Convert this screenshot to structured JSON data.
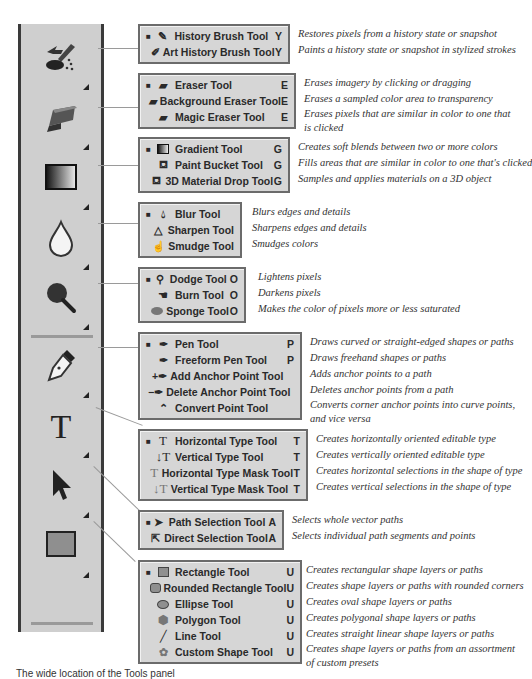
{
  "groups": [
    {
      "id": "history",
      "toolbar_icon": "history-brush-icon",
      "tools": [
        {
          "name": "History Brush Tool",
          "key": "Y",
          "icon": "history-brush-icon",
          "default": true,
          "desc": "Restores pixels from a history state or snapshot"
        },
        {
          "name": "Art History Brush Tool",
          "key": "Y",
          "icon": "art-history-brush-icon",
          "default": false,
          "desc": "Paints a history state or snapshot in stylized strokes"
        }
      ]
    },
    {
      "id": "eraser",
      "toolbar_icon": "eraser-icon",
      "tools": [
        {
          "name": "Eraser Tool",
          "key": "E",
          "icon": "eraser-icon",
          "default": true,
          "desc": "Erases imagery by clicking or dragging"
        },
        {
          "name": "Background Eraser Tool",
          "key": "E",
          "icon": "background-eraser-icon",
          "default": false,
          "desc": "Erases a sampled color area to transparency"
        },
        {
          "name": "Magic Eraser Tool",
          "key": "E",
          "icon": "magic-eraser-icon",
          "default": false,
          "desc": "Erases pixels that are similar in color to one that is clicked"
        }
      ]
    },
    {
      "id": "gradient",
      "toolbar_icon": "gradient-icon",
      "tools": [
        {
          "name": "Gradient Tool",
          "key": "G",
          "icon": "gradient-icon",
          "default": true,
          "desc": "Creates soft blends between two or more colors"
        },
        {
          "name": "Paint Bucket Tool",
          "key": "G",
          "icon": "paint-bucket-icon",
          "default": false,
          "desc": "Fills areas that are similar in color to one that's clicked"
        },
        {
          "name": "3D Material Drop Tool",
          "key": "G",
          "icon": "material-drop-icon",
          "default": false,
          "desc": "Samples and applies materials on a 3D object"
        }
      ]
    },
    {
      "id": "blur",
      "toolbar_icon": "blur-icon",
      "tools": [
        {
          "name": "Blur Tool",
          "key": "",
          "icon": "blur-icon",
          "default": true,
          "desc": "Blurs edges and details"
        },
        {
          "name": "Sharpen Tool",
          "key": "",
          "icon": "sharpen-icon",
          "default": false,
          "desc": "Sharpens edges and details"
        },
        {
          "name": "Smudge Tool",
          "key": "",
          "icon": "smudge-icon",
          "default": false,
          "desc": "Smudges colors"
        }
      ]
    },
    {
      "id": "dodge",
      "toolbar_icon": "dodge-icon",
      "tools": [
        {
          "name": "Dodge Tool",
          "key": "O",
          "icon": "dodge-icon",
          "default": true,
          "desc": "Lightens pixels"
        },
        {
          "name": "Burn Tool",
          "key": "O",
          "icon": "burn-icon",
          "default": false,
          "desc": "Darkens pixels"
        },
        {
          "name": "Sponge Tool",
          "key": "O",
          "icon": "sponge-icon",
          "default": false,
          "desc": "Makes the color of pixels more or less saturated"
        }
      ]
    },
    {
      "id": "pen",
      "toolbar_icon": "pen-icon",
      "tools": [
        {
          "name": "Pen Tool",
          "key": "P",
          "icon": "pen-icon",
          "default": true,
          "desc": "Draws curved or straight-edged shapes or paths"
        },
        {
          "name": "Freeform Pen Tool",
          "key": "P",
          "icon": "freeform-pen-icon",
          "default": false,
          "desc": "Draws freehand shapes or paths"
        },
        {
          "name": "Add Anchor Point Tool",
          "key": "",
          "icon": "add-anchor-icon",
          "default": false,
          "desc": "Adds anchor points to a path"
        },
        {
          "name": "Delete Anchor Point Tool",
          "key": "",
          "icon": "delete-anchor-icon",
          "default": false,
          "desc": "Deletes anchor points from a path"
        },
        {
          "name": "Convert Point Tool",
          "key": "",
          "icon": "convert-point-icon",
          "default": false,
          "desc": "Converts corner anchor points into curve points, and vice versa"
        }
      ]
    },
    {
      "id": "type",
      "toolbar_icon": "type-icon",
      "tools": [
        {
          "name": "Horizontal Type Tool",
          "key": "T",
          "icon": "horizontal-type-icon",
          "default": true,
          "desc": "Creates horizontally oriented editable type"
        },
        {
          "name": "Vertical Type Tool",
          "key": "T",
          "icon": "vertical-type-icon",
          "default": false,
          "desc": "Creates vertically oriented editable type"
        },
        {
          "name": "Horizontal Type Mask Tool",
          "key": "T",
          "icon": "horizontal-type-mask-icon",
          "default": false,
          "desc": "Creates horizontal selections in the shape of type"
        },
        {
          "name": "Vertical Type Mask Tool",
          "key": "T",
          "icon": "vertical-type-mask-icon",
          "default": false,
          "desc": "Creates vertical selections in the shape of type"
        }
      ]
    },
    {
      "id": "selection",
      "toolbar_icon": "path-selection-icon",
      "tools": [
        {
          "name": "Path Selection Tool",
          "key": "A",
          "icon": "path-selection-icon",
          "default": true,
          "desc": "Selects whole vector paths"
        },
        {
          "name": "Direct Selection Tool",
          "key": "A",
          "icon": "direct-selection-icon",
          "default": false,
          "desc": "Selects individual path segments and points"
        }
      ]
    },
    {
      "id": "shape",
      "toolbar_icon": "rectangle-icon",
      "tools": [
        {
          "name": "Rectangle Tool",
          "key": "U",
          "icon": "rectangle-icon",
          "default": true,
          "desc": "Creates rectangular shape layers or paths"
        },
        {
          "name": "Rounded Rectangle Tool",
          "key": "U",
          "icon": "rounded-rectangle-icon",
          "default": false,
          "desc": "Creates shape layers or paths with rounded corners"
        },
        {
          "name": "Ellipse Tool",
          "key": "U",
          "icon": "ellipse-icon",
          "default": false,
          "desc": "Creates oval shape layers or paths"
        },
        {
          "name": "Polygon Tool",
          "key": "U",
          "icon": "polygon-icon",
          "default": false,
          "desc": "Creates polygonal shape layers or paths"
        },
        {
          "name": "Line Tool",
          "key": "U",
          "icon": "line-icon",
          "default": false,
          "desc": "Creates straight linear shape layers or paths"
        },
        {
          "name": "Custom Shape Tool",
          "key": "U",
          "icon": "custom-shape-icon",
          "default": false,
          "desc": "Creates shape layers or paths from an assortment of custom presets"
        }
      ]
    }
  ],
  "caption": "The wide location of the Tools panel"
}
